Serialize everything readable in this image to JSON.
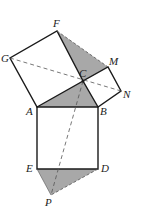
{
  "diagram": {
    "colors": {
      "stroke": "#1a1a1a",
      "shade": "#a8a8a8",
      "dashed": "#555555",
      "background": "#ffffff"
    },
    "points": {
      "F": {
        "label": "F",
        "x": 57,
        "y": 31
      },
      "G": {
        "label": "G",
        "x": 10,
        "y": 58
      },
      "M": {
        "label": "M",
        "x": 108,
        "y": 67
      },
      "C": {
        "label": "C",
        "x": 83,
        "y": 81
      },
      "N": {
        "label": "N",
        "x": 121,
        "y": 91
      },
      "A": {
        "label": "A",
        "x": 37,
        "y": 107
      },
      "B": {
        "label": "B",
        "x": 98,
        "y": 107
      },
      "E": {
        "label": "E",
        "x": 37,
        "y": 169
      },
      "D": {
        "label": "D",
        "x": 98,
        "y": 169
      },
      "P": {
        "label": "P",
        "x": 51,
        "y": 195
      }
    },
    "labels": {
      "F": "F",
      "G": "G",
      "M": "M",
      "C": "C",
      "N": "N",
      "A": "A",
      "B": "B",
      "E": "E",
      "D": "D",
      "P": "P"
    }
  }
}
